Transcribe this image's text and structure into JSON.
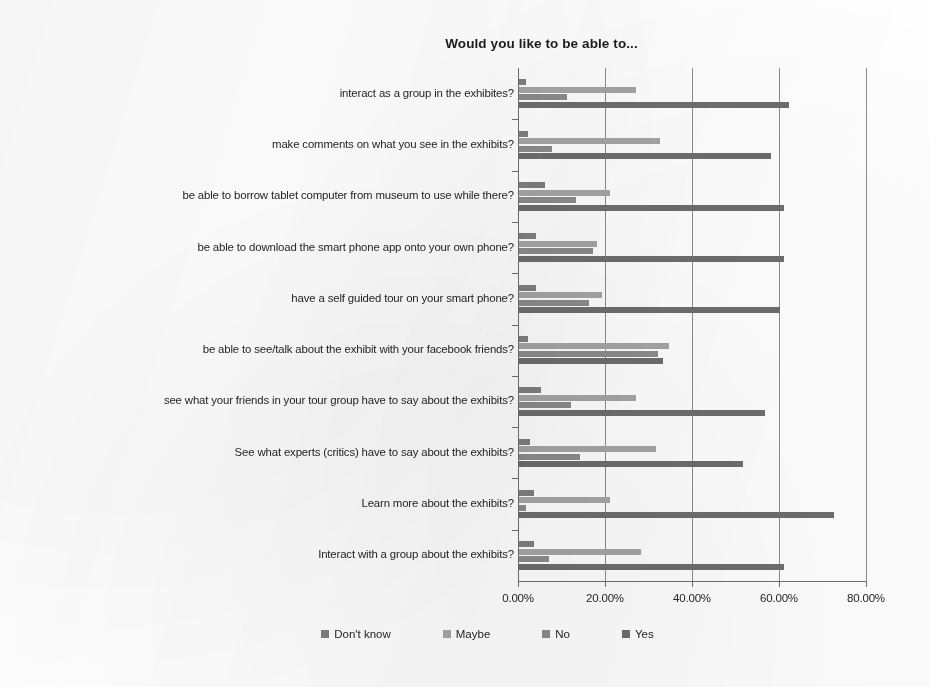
{
  "chart_data": {
    "type": "bar",
    "orientation": "horizontal",
    "title": "Would you like to be able to...",
    "xlabel": "",
    "ylabel": "",
    "xlim": [
      0,
      80
    ],
    "xticks": [
      "0.00%",
      "20.00%",
      "40.00%",
      "60.00%",
      "80.00%"
    ],
    "xtick_values": [
      0,
      20,
      40,
      60,
      80
    ],
    "grid": true,
    "legend_position": "bottom",
    "categories": [
      "interact as a group in the exhibites?",
      "make comments on what you see in the exhibits?",
      "be able to borrow tablet computer from museum to use while there?",
      "be able to download the smart phone app onto your own phone?",
      "have a self guided tour on your smart phone?",
      "be able to see/talk about the exhibit with your facebook friends?",
      "see what your friends in your tour group have to say about the exhibits?",
      "See what experts (critics) have to say about the exhibits?",
      "Learn more about the exhibits?",
      "Interact with a group about the exhibits?"
    ],
    "series": [
      {
        "name": "Don't know",
        "color": "#7f7f7f",
        "values": [
          1.5,
          2.0,
          6.0,
          4.0,
          4.0,
          2.0,
          5.0,
          2.5,
          3.5,
          3.5
        ]
      },
      {
        "name": "Maybe",
        "color": "#a6a6a6",
        "values": [
          27.0,
          32.5,
          21.0,
          18.0,
          19.0,
          34.5,
          27.0,
          31.5,
          21.0,
          28.0
        ]
      },
      {
        "name": "No",
        "color": "#8c8c8c",
        "values": [
          11.0,
          7.5,
          13.0,
          17.0,
          16.0,
          32.0,
          12.0,
          14.0,
          1.5,
          7.0
        ]
      },
      {
        "name": "Yes",
        "color": "#6e6e6e",
        "values": [
          62.0,
          58.0,
          61.0,
          61.0,
          60.0,
          33.0,
          56.5,
          51.5,
          72.5,
          61.0
        ]
      }
    ]
  },
  "legend": {
    "items": [
      {
        "label": "Don't know",
        "color": "#7f7f7f"
      },
      {
        "label": "Maybe",
        "color": "#a6a6a6"
      },
      {
        "label": "No",
        "color": "#8c8c8c"
      },
      {
        "label": "Yes",
        "color": "#6e6e6e"
      }
    ]
  }
}
